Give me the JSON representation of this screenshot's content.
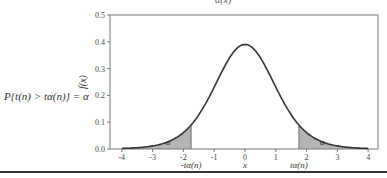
{
  "title_fragment": "α(x)",
  "formula": "P{t(n) > tα(n)} = α",
  "chart_data": {
    "type": "line",
    "title": "",
    "xlabel": "x",
    "ylabel": "f(x)",
    "xlim": [
      -4,
      4
    ],
    "ylim": [
      0.0,
      0.5
    ],
    "xticks": [
      "-4",
      "-3",
      "-2",
      "-1",
      "0",
      "1",
      "2",
      "3",
      "4"
    ],
    "yticks": [
      "0.0",
      "0.1",
      "0.2",
      "0.3",
      "0.4",
      "0.5"
    ],
    "grid": false,
    "series": [
      {
        "name": "t-distribution density f(x)",
        "peak": 0.39,
        "x": [
          -4,
          -3,
          -2,
          -1,
          0,
          1,
          2,
          3,
          4
        ],
        "values": [
          0.006,
          0.02,
          0.07,
          0.23,
          0.39,
          0.23,
          0.07,
          0.02,
          0.006
        ]
      }
    ],
    "shaded_regions": [
      {
        "from": -4,
        "to": -1.75,
        "label": "α"
      },
      {
        "from": 1.75,
        "to": 4,
        "label": "α"
      }
    ],
    "annotations": [
      {
        "text": "-tα(n)",
        "x": -1.75
      },
      {
        "text": "tα(n)",
        "x": 1.75
      },
      {
        "text": "α",
        "x": -2.5
      },
      {
        "text": "α",
        "x": 2.5
      }
    ]
  }
}
